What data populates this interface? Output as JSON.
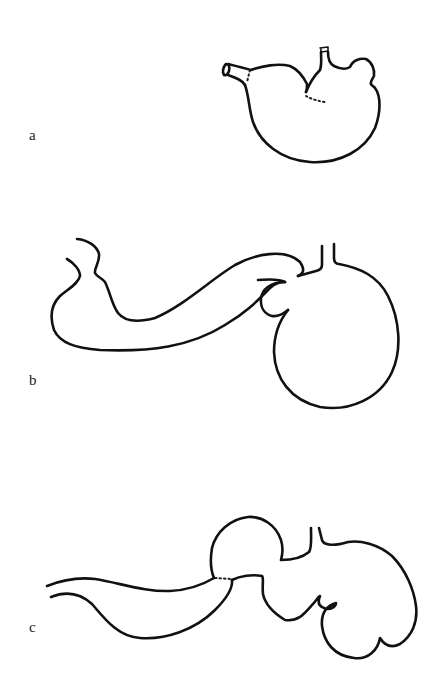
{
  "figure": {
    "panels": [
      {
        "label": "a",
        "description": "stomach with short duodenal stump and oesophagus"
      },
      {
        "label": "b",
        "description": "stomach with long looped intestinal segment"
      },
      {
        "label": "c",
        "description": "lobulated stomach with bulb and intestinal segment"
      }
    ],
    "colors": {
      "line": "#111111",
      "background": "#ffffff"
    }
  }
}
